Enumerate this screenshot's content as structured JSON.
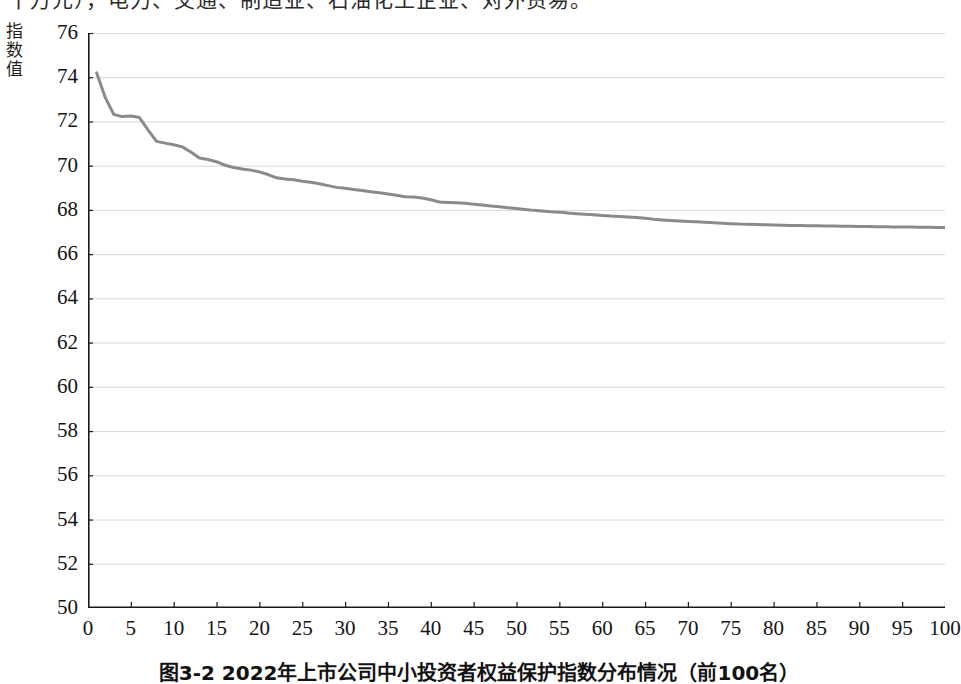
{
  "page": {
    "top_cut_text": "十万元），电力、交通、制造业、石油化工企业、对外贸易。",
    "caption": "图3-2  2022年上市公司中小投资者权益保护指数分布情况（前100名）"
  },
  "chart_data": {
    "type": "line",
    "title": "",
    "xlabel": "",
    "ylabel": "指数值",
    "xlim": [
      0,
      100
    ],
    "ylim": [
      50,
      76
    ],
    "grid": "horizontal",
    "legend": "none",
    "line_color": "#8a8a8a",
    "axis_color": "#1a1a1a",
    "gridline_color": "#d9d9d9",
    "xticks": [
      0,
      5,
      10,
      15,
      20,
      25,
      30,
      35,
      40,
      45,
      50,
      55,
      60,
      65,
      70,
      75,
      80,
      85,
      90,
      95,
      100
    ],
    "yticks": [
      50,
      52,
      54,
      56,
      58,
      60,
      62,
      64,
      66,
      68,
      70,
      72,
      74,
      76
    ],
    "series": [
      {
        "name": "中小投资者权益保护指数",
        "x": [
          1,
          2,
          3,
          4,
          5,
          6,
          7,
          8,
          9,
          10,
          11,
          12,
          13,
          14,
          15,
          16,
          17,
          18,
          19,
          20,
          21,
          22,
          23,
          24,
          25,
          26,
          27,
          28,
          29,
          30,
          31,
          32,
          33,
          34,
          35,
          36,
          37,
          38,
          39,
          40,
          41,
          42,
          43,
          44,
          45,
          46,
          47,
          48,
          49,
          50,
          51,
          52,
          53,
          54,
          55,
          56,
          57,
          58,
          59,
          60,
          61,
          62,
          63,
          64,
          65,
          66,
          67,
          68,
          69,
          70,
          71,
          72,
          73,
          74,
          75,
          76,
          77,
          78,
          79,
          80,
          81,
          82,
          83,
          84,
          85,
          86,
          87,
          88,
          89,
          90,
          91,
          92,
          93,
          94,
          95,
          96,
          97,
          98,
          99,
          100
        ],
        "values": [
          74.2,
          73.1,
          72.32,
          72.22,
          72.25,
          72.18,
          71.62,
          71.1,
          71.02,
          70.95,
          70.85,
          70.62,
          70.35,
          70.28,
          70.18,
          70.02,
          69.92,
          69.85,
          69.8,
          69.72,
          69.6,
          69.45,
          69.4,
          69.36,
          69.3,
          69.25,
          69.18,
          69.1,
          69.02,
          68.98,
          68.92,
          68.88,
          68.82,
          68.78,
          68.72,
          68.66,
          68.6,
          68.58,
          68.54,
          68.46,
          68.36,
          68.34,
          68.32,
          68.3,
          68.26,
          68.22,
          68.18,
          68.14,
          68.1,
          68.06,
          68.02,
          67.98,
          67.95,
          67.92,
          67.9,
          67.86,
          67.83,
          67.8,
          67.78,
          67.75,
          67.72,
          67.7,
          67.68,
          67.66,
          67.62,
          67.58,
          67.55,
          67.52,
          67.5,
          67.48,
          67.46,
          67.44,
          67.42,
          67.4,
          67.38,
          67.36,
          67.35,
          67.34,
          67.33,
          67.32,
          67.31,
          67.3,
          67.29,
          67.28,
          67.28,
          67.27,
          67.27,
          67.26,
          67.26,
          67.25,
          67.25,
          67.24,
          67.24,
          67.23,
          67.23,
          67.23,
          67.22,
          67.22,
          67.21,
          67.2
        ]
      }
    ]
  }
}
